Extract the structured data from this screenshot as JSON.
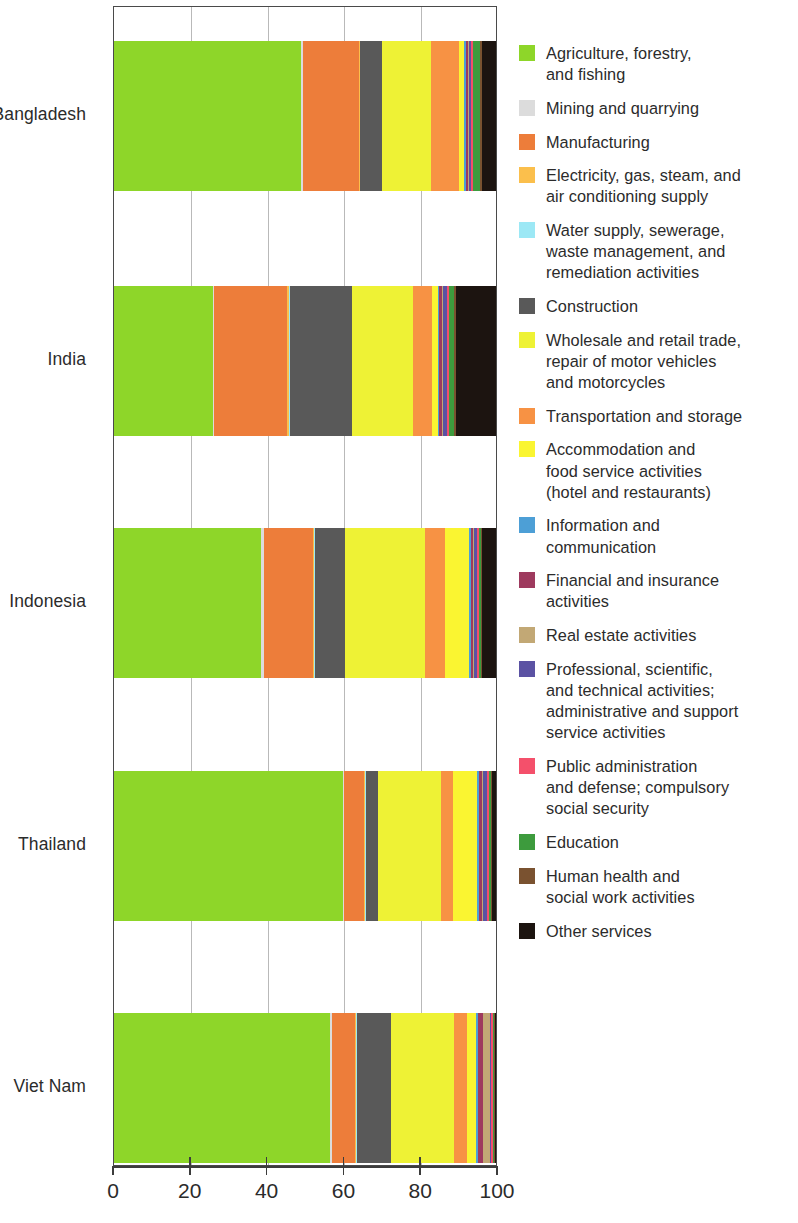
{
  "chart_data": {
    "type": "bar",
    "orientation": "horizontal",
    "stacked": true,
    "title": "",
    "xlabel": "",
    "ylabel": "",
    "xlim": [
      0,
      100
    ],
    "xticks": [
      0,
      20,
      40,
      60,
      80,
      100
    ],
    "xtick_labels": [
      "0",
      "20",
      "40",
      "60",
      "80",
      "100"
    ],
    "grid": true,
    "legend_position": "right",
    "categories": [
      "Bangladesh",
      "India",
      "Indonesia",
      "Thailand",
      "Viet Nam"
    ],
    "series": [
      {
        "name": "Agriculture, forestry, and fishing",
        "color": "#8ED629",
        "values": [
          49.0,
          25.8,
          38.5,
          60.0,
          56.8
        ]
      },
      {
        "name": "Mining and quarrying",
        "color": "#DCDCDC",
        "values": [
          0.4,
          0.5,
          0.8,
          0.3,
          0.5
        ]
      },
      {
        "name": "Manufacturing",
        "color": "#ED7D3A",
        "values": [
          14.6,
          19.0,
          12.8,
          5.2,
          6.0
        ]
      },
      {
        "name": "Electricity, gas, steam, and air conditioning supply",
        "color": "#FBBF4C",
        "values": [
          0.3,
          0.4,
          0.3,
          0.3,
          0.3
        ]
      },
      {
        "name": "Water supply, sewerage, waste management, and remediation activities",
        "color": "#9CE8F5",
        "values": [
          0.2,
          0.3,
          0.3,
          0.2,
          0.3
        ]
      },
      {
        "name": "Construction",
        "color": "#595959",
        "values": [
          5.6,
          16.4,
          7.8,
          3.2,
          8.7
        ]
      },
      {
        "name": "Wholesale and retail trade, repair of motor vehicles and motorcycles",
        "color": "#EEF235",
        "values": [
          12.9,
          15.8,
          20.9,
          16.4,
          16.6
        ]
      },
      {
        "name": "Transportation and storage",
        "color": "#F79244",
        "values": [
          7.2,
          5.0,
          5.2,
          3.0,
          3.4
        ]
      },
      {
        "name": "Accommodation and food service activities (hotel and restaurants)",
        "color": "#FAF531",
        "values": [
          1.5,
          1.5,
          6.4,
          6.5,
          2.5
        ]
      },
      {
        "name": "Information and communication",
        "color": "#4D9FD6",
        "values": [
          0.3,
          0.4,
          0.4,
          0.4,
          0.4
        ]
      },
      {
        "name": "Financial and insurance activities",
        "color": "#9E3A5E",
        "values": [
          0.6,
          0.7,
          0.6,
          0.7,
          1.3
        ]
      },
      {
        "name": "Real estate activities",
        "color": "#C2A875",
        "values": [
          0.3,
          0.3,
          0.3,
          0.3,
          1.8
        ]
      },
      {
        "name": "Professional, scientific, and technical activities; administrative and support service activities",
        "color": "#5B52A3",
        "values": [
          0.6,
          1.1,
          0.8,
          1.2,
          0.5
        ]
      },
      {
        "name": "Public administration and defense; compulsory social security",
        "color": "#F4506B",
        "values": [
          0.4,
          0.6,
          0.4,
          0.4,
          0.4
        ]
      },
      {
        "name": "Education",
        "color": "#3D9B3D",
        "values": [
          2.0,
          1.3,
          0.6,
          0.5,
          0.3
        ]
      },
      {
        "name": "Human health and social work activities",
        "color": "#7A5230",
        "values": [
          0.3,
          0.3,
          0.3,
          0.3,
          0.2
        ]
      },
      {
        "name": "Other services",
        "color": "#1C1410",
        "values": [
          3.8,
          10.6,
          3.6,
          1.1,
          0.3
        ]
      }
    ]
  },
  "legend": {
    "items": [
      {
        "label": "Agriculture, forestry,\nand fishing",
        "color": "#8ED629",
        "icon": "legend-swatch-agriculture"
      },
      {
        "label": "Mining and quarrying",
        "color": "#DCDCDC",
        "icon": "legend-swatch-mining"
      },
      {
        "label": "Manufacturing",
        "color": "#ED7D3A",
        "icon": "legend-swatch-manufacturing"
      },
      {
        "label": "Electricity, gas, steam, and\nair conditioning supply",
        "color": "#FBBF4C",
        "icon": "legend-swatch-electricity"
      },
      {
        "label": "Water supply, sewerage,\nwaste management, and\nremediation activities",
        "color": "#9CE8F5",
        "icon": "legend-swatch-water"
      },
      {
        "label": "Construction",
        "color": "#595959",
        "icon": "legend-swatch-construction"
      },
      {
        "label": "Wholesale and retail trade,\nrepair of motor vehicles\nand motorcycles",
        "color": "#EEF235",
        "icon": "legend-swatch-wholesale"
      },
      {
        "label": "Transportation and storage",
        "color": "#F79244",
        "icon": "legend-swatch-transportation"
      },
      {
        "label": "Accommodation and\nfood service activities\n(hotel and restaurants)",
        "color": "#FAF531",
        "icon": "legend-swatch-accommodation"
      },
      {
        "label": "Information and\ncommunication",
        "color": "#4D9FD6",
        "icon": "legend-swatch-information"
      },
      {
        "label": "Financial and insurance\nactivities",
        "color": "#9E3A5E",
        "icon": "legend-swatch-financial"
      },
      {
        "label": "Real estate activities",
        "color": "#C2A875",
        "icon": "legend-swatch-realestate"
      },
      {
        "label": "Professional, scientific,\nand technical activities;\nadministrative and support\nservice activities",
        "color": "#5B52A3",
        "icon": "legend-swatch-professional"
      },
      {
        "label": "Public administration\nand defense; compulsory\nsocial security",
        "color": "#F4506B",
        "icon": "legend-swatch-publicadmin"
      },
      {
        "label": "Education",
        "color": "#3D9B3D",
        "icon": "legend-swatch-education"
      },
      {
        "label": "Human health and\nsocial work activities",
        "color": "#7A5230",
        "icon": "legend-swatch-health"
      },
      {
        "label": "Other services",
        "color": "#1C1410",
        "icon": "legend-swatch-other"
      }
    ]
  }
}
